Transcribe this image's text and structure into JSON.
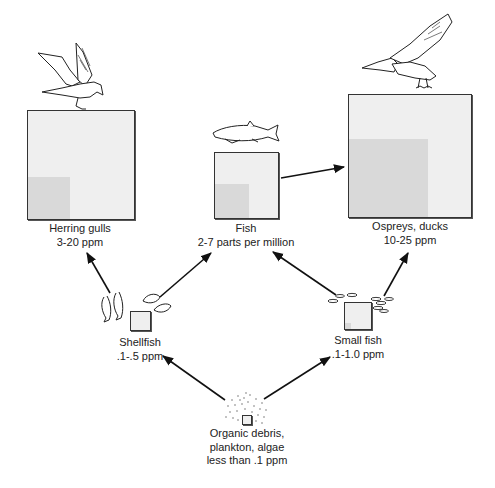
{
  "nodes": {
    "herring_gulls": {
      "name": "Herring gulls",
      "value": "3-20 ppm",
      "icon": "gull-icon"
    },
    "fish": {
      "name": "Fish",
      "value": "2-7 parts per million",
      "icon": "fish-icon"
    },
    "ospreys": {
      "name": "Ospreys, ducks",
      "value": "10-25 ppm",
      "icon": "osprey-icon"
    },
    "shellfish": {
      "name": "Shellfish",
      "value": ".1-.5 ppm",
      "icon": "shellfish-icon"
    },
    "small_fish": {
      "name": "Small fish",
      "value": ".1-1.0 ppm",
      "icon": "small-fish-icon"
    },
    "plankton": {
      "name": "Organic debris,",
      "name2": "plankton, algae",
      "value": "less than .1 ppm",
      "icon": "plankton-dots-icon"
    }
  },
  "edges": [
    {
      "from": "plankton",
      "to": "shellfish"
    },
    {
      "from": "plankton",
      "to": "small_fish"
    },
    {
      "from": "shellfish",
      "to": "herring_gulls"
    },
    {
      "from": "shellfish",
      "to": "fish"
    },
    {
      "from": "small_fish",
      "to": "fish"
    },
    {
      "from": "small_fish",
      "to": "ospreys"
    },
    {
      "from": "fish",
      "to": "ospreys"
    }
  ],
  "colors": {
    "box_fill": "#efefef",
    "box_inner": "#d9d9d9",
    "stroke": "#222222"
  }
}
